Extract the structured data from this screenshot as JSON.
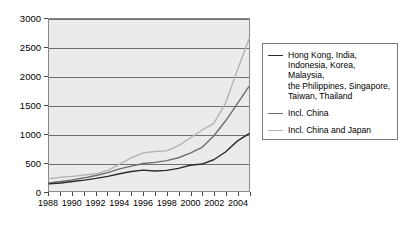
{
  "chart_data": {
    "type": "line",
    "title": "",
    "xlabel": "",
    "ylabel": "",
    "xlim": [
      1988,
      2005
    ],
    "ylim": [
      0,
      3000
    ],
    "grid": true,
    "legend_position": "right",
    "x": [
      1988,
      1989,
      1990,
      1991,
      1992,
      1993,
      1994,
      1995,
      1996,
      1997,
      1998,
      1999,
      2000,
      2001,
      2002,
      2003,
      2004,
      2005
    ],
    "yticks": [
      0,
      500,
      1000,
      1500,
      2000,
      2500,
      3000
    ],
    "ytick_labels": [
      "0",
      "500",
      "1000",
      "1500",
      "2000",
      "2500",
      "3000"
    ],
    "xticks": [
      1988,
      1989,
      1990,
      1991,
      1992,
      1993,
      1994,
      1995,
      1996,
      1997,
      1998,
      1999,
      2000,
      2001,
      2002,
      2003,
      2004,
      2005
    ],
    "xtick_labels": [
      "1988",
      "",
      "1990",
      "",
      "1992",
      "",
      "1994",
      "",
      "1996",
      "",
      "1998",
      "",
      "2000",
      "",
      "2002",
      "",
      "2004",
      ""
    ],
    "series": [
      {
        "name": "Hong Kong, India,\nIndonesia, Korea, Malaysia,\nthe Philippines, Singapore,\nTaiwan, Thailand",
        "color": "#2b2b2b",
        "values": [
          125,
          140,
          165,
          190,
          220,
          255,
          300,
          340,
          365,
          350,
          360,
          395,
          450,
          470,
          545,
          680,
          870,
          1000
        ]
      },
      {
        "name": "Incl. China",
        "color": "#6e6e6e",
        "values": [
          140,
          165,
          195,
          230,
          270,
          320,
          385,
          435,
          480,
          500,
          530,
          580,
          660,
          760,
          960,
          1220,
          1520,
          1825
        ]
      },
      {
        "name": "Incl. China and Japan",
        "color": "#b4b4b4",
        "values": [
          215,
          240,
          255,
          280,
          300,
          360,
          470,
          580,
          665,
          690,
          700,
          790,
          925,
          1060,
          1180,
          1530,
          2100,
          2650
        ]
      }
    ]
  },
  "legend": {
    "entries": [
      {
        "label": "Hong Kong, India,\nIndonesia, Korea, Malaysia,\nthe Philippines, Singapore,\nTaiwan, Thailand",
        "color": "#2b2b2b"
      },
      {
        "label": "Incl. China",
        "color": "#6e6e6e"
      },
      {
        "label": "Incl. China and Japan",
        "color": "#b4b4b4"
      }
    ]
  }
}
